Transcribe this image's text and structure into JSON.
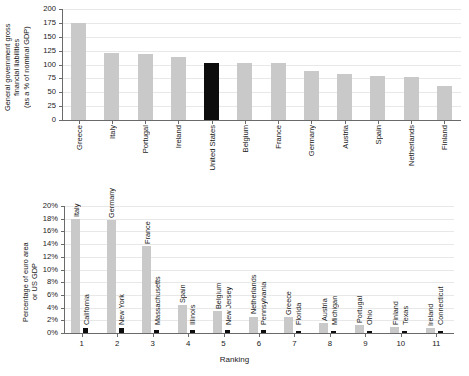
{
  "chart_data": [
    {
      "type": "bar",
      "panel": "top",
      "title": "",
      "xlabel": "",
      "ylabel": "General government gross\nfinancial liabilities\n(as a % of nominal GDP)",
      "ylim": [
        0,
        200
      ],
      "yticks": [
        0,
        25,
        50,
        75,
        100,
        125,
        150,
        175,
        200
      ],
      "ytick_labels": [
        "0",
        "25",
        "50",
        "75",
        "100",
        "125",
        "150",
        "175",
        "200"
      ],
      "grid": true,
      "legend": "none",
      "categories": [
        "Greece",
        "Italy",
        "Portugal",
        "Ireland",
        "United States",
        "Belgium",
        "France",
        "Germany",
        "Austria",
        "Spain",
        "Netherlands",
        "Finland"
      ],
      "values": [
        175,
        120,
        119,
        113,
        103,
        103,
        102,
        89,
        83,
        80,
        78,
        61
      ],
      "highlight_category": "United States",
      "colors": {
        "bar": "#c9c9c9",
        "highlight": "#0d0d0d"
      }
    },
    {
      "type": "bar",
      "panel": "bottom",
      "title": "",
      "xlabel": "Ranking",
      "ylabel": "Percentage of euro area\nor US GDP",
      "ylim": [
        0,
        20
      ],
      "yticks": [
        0,
        2,
        4,
        6,
        8,
        10,
        12,
        14,
        16,
        18,
        20
      ],
      "ytick_labels": [
        "0%",
        "2%",
        "4%",
        "6%",
        "8%",
        "10%",
        "12%",
        "14%",
        "16%",
        "18%",
        "20%"
      ],
      "grid": true,
      "categories": [
        "1",
        "2",
        "3",
        "4",
        "5",
        "6",
        "7",
        "8",
        "9",
        "10",
        "11"
      ],
      "series": [
        {
          "name": "Euro area countries",
          "color": "#c9c9c9",
          "point_labels": [
            "Italy",
            "Germany",
            "France",
            "Spain",
            "Belgium",
            "Netherlands",
            "Greece",
            "Austria",
            "Portugal",
            "Finland",
            "Ireland"
          ],
          "values": [
            18.0,
            17.8,
            13.7,
            4.4,
            3.4,
            2.6,
            2.5,
            1.6,
            1.3,
            0.9,
            0.8
          ]
        },
        {
          "name": "US states",
          "color": "#0d0d0d",
          "point_labels": [
            "California",
            "New York",
            "Massachusetts",
            "Illinois",
            "New Jersey",
            "Pennsylvania",
            "Florida",
            "Michigan",
            "Ohio",
            "Texas",
            "Connecticut"
          ],
          "values": [
            0.85,
            0.85,
            0.55,
            0.4,
            0.45,
            0.4,
            0.35,
            0.3,
            0.28,
            0.3,
            0.3
          ]
        }
      ]
    }
  ]
}
